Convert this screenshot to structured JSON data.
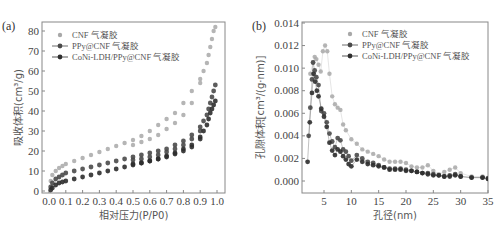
{
  "colors": {
    "cnf": "#a8a8a8",
    "ppy": "#4a4a4a",
    "coni": "#2e2e2e",
    "axis": "#888888",
    "text": "#444444"
  },
  "chart_data": [
    {
      "panel": "(a)",
      "type": "scatter",
      "title": "",
      "xlabel": "相对压力(P/P0)",
      "ylabel": "吸收体积(cm³/g)",
      "xlim": [
        -0.05,
        1.05
      ],
      "ylim": [
        0,
        85
      ],
      "xticks": [
        "0.0",
        "0.1",
        "0.2",
        "0.3",
        "0.4",
        "0.5",
        "0.6",
        "0.7",
        "0.8",
        "0.9",
        "1.0"
      ],
      "yticks": [
        "0",
        "10",
        "20",
        "30",
        "40",
        "50",
        "60",
        "70",
        "80"
      ],
      "grid": false,
      "legend_position": "upper left",
      "series": [
        {
          "name": "CNF 气凝胶",
          "x": [
            0.01,
            0.02,
            0.04,
            0.06,
            0.08,
            0.1,
            0.15,
            0.2,
            0.25,
            0.3,
            0.35,
            0.4,
            0.45,
            0.5,
            0.55,
            0.6,
            0.65,
            0.7,
            0.75,
            0.8,
            0.85,
            0.9,
            0.92,
            0.94,
            0.95,
            0.96,
            0.97,
            0.98,
            0.99,
            0.9,
            0.85,
            0.8,
            0.75,
            0.7,
            0.65,
            0.6,
            0.55,
            0.5
          ],
          "y": [
            5,
            8,
            10,
            11.5,
            12.5,
            13.5,
            15,
            16.5,
            18,
            19.5,
            21,
            22.5,
            24,
            25.5,
            27.5,
            30,
            33,
            36,
            39,
            44,
            50,
            56,
            60,
            64,
            68,
            72,
            76,
            80,
            82,
            54,
            44,
            38,
            34,
            31,
            28,
            26,
            24.5,
            23
          ]
        },
        {
          "name": "PPy@CNF 气凝胶",
          "x": [
            0.01,
            0.02,
            0.04,
            0.06,
            0.08,
            0.1,
            0.15,
            0.2,
            0.25,
            0.3,
            0.35,
            0.4,
            0.45,
            0.5,
            0.55,
            0.6,
            0.65,
            0.7,
            0.75,
            0.8,
            0.85,
            0.9,
            0.92,
            0.94,
            0.95,
            0.96,
            0.97,
            0.98,
            0.99,
            0.9,
            0.85,
            0.8,
            0.75,
            0.7,
            0.65,
            0.6,
            0.55,
            0.5
          ],
          "y": [
            2,
            4,
            6,
            7,
            8,
            9,
            10,
            11,
            12,
            13,
            14,
            15,
            16,
            17,
            18,
            19,
            20,
            21,
            23,
            25,
            28,
            32,
            35,
            38,
            41,
            44,
            47,
            50,
            53,
            30,
            26,
            23,
            21,
            19.5,
            18,
            17,
            16,
            15.5
          ]
        },
        {
          "name": "CoNi-LDH/PPy@CNF 气凝胶",
          "x": [
            0.01,
            0.02,
            0.04,
            0.06,
            0.08,
            0.1,
            0.15,
            0.2,
            0.25,
            0.3,
            0.35,
            0.4,
            0.45,
            0.5,
            0.55,
            0.6,
            0.65,
            0.7,
            0.75,
            0.8,
            0.85,
            0.9,
            0.92,
            0.94,
            0.95,
            0.96,
            0.97,
            0.98,
            0.99,
            0.9,
            0.85,
            0.8,
            0.75,
            0.7,
            0.65,
            0.6,
            0.55,
            0.5
          ],
          "y": [
            0.5,
            1.5,
            3,
            4,
            4.5,
            5,
            6,
            7,
            8,
            9,
            10,
            11,
            12,
            13,
            14,
            15,
            16,
            17.5,
            19,
            21,
            23,
            27,
            30,
            33,
            36,
            39,
            41,
            43,
            45,
            26,
            22,
            20,
            18.5,
            17,
            16,
            15,
            14,
            13.5
          ]
        }
      ]
    },
    {
      "panel": "(b)",
      "type": "scatter",
      "title": "",
      "xlabel": "孔径(nm)",
      "ylabel": "孔隙体积[cm³/(g·nm)]",
      "xlim": [
        1,
        35
      ],
      "ylim": [
        -0.001,
        0.014
      ],
      "xticks": [
        "5",
        "10",
        "15",
        "20",
        "25",
        "30",
        "35"
      ],
      "yticks": [
        "0.000",
        "0.002",
        "0.004",
        "0.006",
        "0.008",
        "0.010",
        "0.012",
        "0.014"
      ],
      "grid": false,
      "legend_position": "upper right",
      "series": [
        {
          "name": "CNF 气凝胶",
          "x": [
            2.5,
            3,
            3.3,
            3.6,
            4,
            4.4,
            4.8,
            5.2,
            5.6,
            6,
            6.5,
            7,
            7.5,
            8,
            8.5,
            9,
            10,
            11,
            12,
            13,
            14,
            15,
            16,
            17,
            18,
            19,
            20,
            21,
            22,
            23,
            24,
            25,
            26,
            27,
            28,
            29,
            30,
            32,
            34,
            35
          ],
          "y": [
            0.0095,
            0.0105,
            0.011,
            0.0108,
            0.0103,
            0.0097,
            0.0115,
            0.012,
            0.0115,
            0.0095,
            0.0075,
            0.0068,
            0.0065,
            0.0063,
            0.005,
            0.0045,
            0.0037,
            0.0033,
            0.0028,
            0.0026,
            0.0024,
            0.0022,
            0.0019,
            0.0017,
            0.0017,
            0.0017,
            0.0016,
            0.0013,
            0.0012,
            0.0012,
            0.0014,
            0.0009,
            0.0006,
            0.0008,
            0.001,
            0.0012,
            0.0007,
            0.0004,
            0.0004,
            0.0003
          ]
        },
        {
          "name": "PPy@CNF 气凝胶",
          "x": [
            2.2,
            2.5,
            2.8,
            3,
            3.3,
            3.6,
            4,
            4.5,
            5,
            5.5,
            6,
            6.5,
            7,
            7.5,
            8,
            8.5,
            9,
            9.5,
            10,
            11,
            12,
            13,
            14,
            15,
            16,
            17,
            18,
            19,
            20,
            21,
            22,
            23,
            24,
            25,
            26,
            27,
            28,
            29,
            30,
            32,
            34,
            35
          ],
          "y": [
            0.004,
            0.0065,
            0.009,
            0.0105,
            0.0098,
            0.0092,
            0.0085,
            0.0062,
            0.006,
            0.0052,
            0.0042,
            0.0035,
            0.003,
            0.0038,
            0.0036,
            0.0028,
            0.0026,
            0.0022,
            0.0018,
            0.0023,
            0.002,
            0.0017,
            0.0016,
            0.0014,
            0.0012,
            0.0011,
            0.0011,
            0.0011,
            0.001,
            0.0009,
            0.0008,
            0.0007,
            0.0007,
            0.0006,
            0.0005,
            0.0004,
            0.0005,
            0.0006,
            0.0004,
            0.0003,
            0.0003,
            0.0002
          ]
        },
        {
          "name": "CoNi-LDH/PPy@CNF 气凝胶",
          "x": [
            2,
            2.4,
            2.8,
            3.1,
            3.4,
            3.7,
            4,
            4.5,
            5,
            5.5,
            6,
            6.5,
            7,
            7.5,
            8,
            8.5,
            9,
            9.5,
            10,
            11,
            12,
            13,
            14,
            15,
            16,
            17,
            18,
            19,
            20,
            21,
            22,
            23,
            24,
            25,
            26,
            27,
            28,
            29,
            30,
            32,
            34,
            35
          ],
          "y": [
            0.0017,
            0.0052,
            0.0078,
            0.0095,
            0.0088,
            0.008,
            0.0075,
            0.0064,
            0.0057,
            0.0048,
            0.0034,
            0.0027,
            0.0023,
            0.0028,
            0.0026,
            0.0022,
            0.0019,
            0.0015,
            0.0013,
            0.0019,
            0.0017,
            0.0015,
            0.0014,
            0.0013,
            0.0012,
            0.001,
            0.001,
            0.001,
            0.0009,
            0.0009,
            0.0008,
            0.0007,
            0.0006,
            0.0005,
            0.0005,
            0.0004,
            0.0004,
            0.0005,
            0.0004,
            0.0003,
            0.0003,
            0.0002
          ]
        }
      ]
    }
  ]
}
